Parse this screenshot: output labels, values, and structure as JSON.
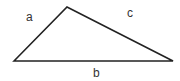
{
  "diagram": {
    "type": "triangle",
    "stroke_color": "#222222",
    "vertices": {
      "left": [
        14,
        61
      ],
      "top": [
        67,
        7
      ],
      "right": [
        173,
        61
      ]
    },
    "sides": [
      {
        "id": "a",
        "label": "a",
        "from": "left",
        "to": "top",
        "label_pos": [
          30,
          21
        ]
      },
      {
        "id": "c",
        "label": "c",
        "from": "top",
        "to": "right",
        "label_pos": [
          131,
          17
        ]
      },
      {
        "id": "b",
        "label": "b",
        "from": "left",
        "to": "right",
        "label_pos": [
          97,
          77
        ]
      }
    ]
  }
}
